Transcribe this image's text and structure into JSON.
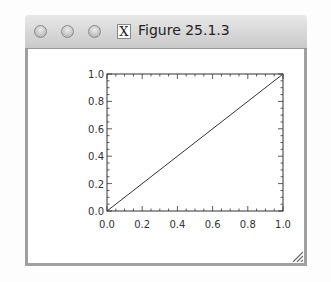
{
  "window": {
    "title": "Figure 25.1.3",
    "buttons": [
      "close",
      "minimize",
      "zoom"
    ],
    "x11_icon": "X"
  },
  "chart_data": {
    "type": "line",
    "title": "",
    "xlabel": "",
    "ylabel": "",
    "xlim": [
      0.0,
      1.0
    ],
    "ylim": [
      0.0,
      1.0
    ],
    "x_ticks": [
      "0.0",
      "0.2",
      "0.4",
      "0.6",
      "0.8",
      "1.0"
    ],
    "y_ticks": [
      "0.0",
      "0.2",
      "0.4",
      "0.6",
      "0.8",
      "1.0"
    ],
    "grid": false,
    "legend": null,
    "series": [
      {
        "name": "line",
        "x": [
          0.0,
          1.0
        ],
        "y": [
          0.0,
          1.0
        ],
        "color": "#333333"
      }
    ]
  }
}
